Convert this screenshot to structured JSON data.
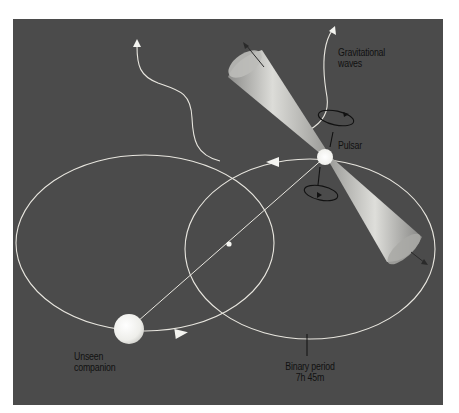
{
  "figure": {
    "colors": {
      "page_background": "#ffffff",
      "panel_background": "#4b4b4b",
      "orbit_line": "#e8e6df",
      "label_text": "#111111",
      "pulsar": "#f4f4f0",
      "companion": "#eeeeea",
      "beam_light": "#d9d9d6",
      "beam_dark": "#8a8a88",
      "spin_ring": "#111111"
    },
    "labels": {
      "gravitational_waves_line1": "Gravitational",
      "gravitational_waves_line2": "waves",
      "pulsar": "Pulsar",
      "companion_line1": "Unseen",
      "companion_line2": "companion",
      "binary_period_line1": "Binary period",
      "binary_period_line2": "7h 45m"
    },
    "objects": [
      {
        "name": "pulsar",
        "x": 325,
        "y": 157,
        "r": 8
      },
      {
        "name": "unseen-companion",
        "x": 129,
        "y": 329,
        "r": 15
      },
      {
        "name": "center-of-mass",
        "x": 229,
        "y": 244
      }
    ],
    "orbits": [
      {
        "name": "companion-orbit",
        "cx": 145,
        "cy": 243,
        "rx": 129,
        "ry": 88
      },
      {
        "name": "pulsar-orbit",
        "cx": 310,
        "cy": 250,
        "rx": 125,
        "ry": 90
      }
    ],
    "binary_period": "7h 45m"
  }
}
